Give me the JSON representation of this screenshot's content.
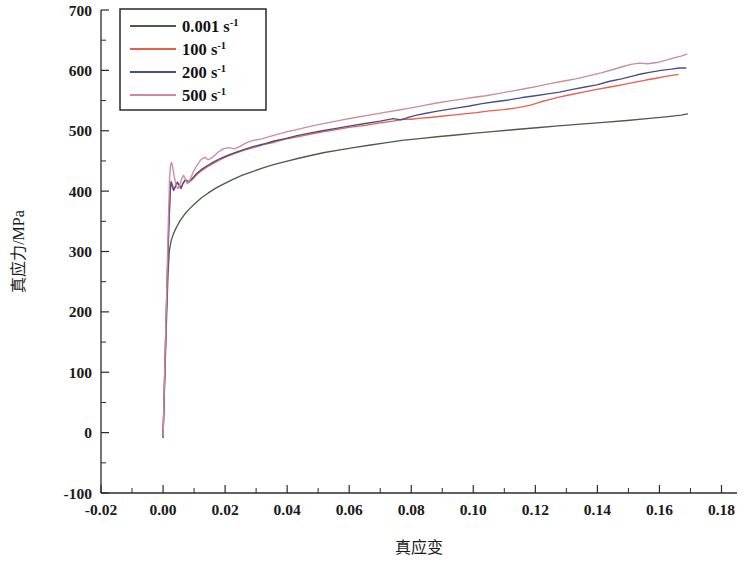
{
  "chart_data": {
    "type": "line",
    "title": "",
    "xlabel": "真应变",
    "ylabel": "真应力/MPa",
    "xlim": [
      -0.02,
      0.185
    ],
    "ylim": [
      -100,
      700
    ],
    "xticks": [
      -0.02,
      0.0,
      0.02,
      0.04,
      0.06,
      0.08,
      0.1,
      0.12,
      0.14,
      0.16,
      0.18
    ],
    "xticklabels": [
      "-0.02",
      "0.00",
      "0.02",
      "0.04",
      "0.06",
      "0.08",
      "0.10",
      "0.12",
      "0.14",
      "0.16",
      "0.18"
    ],
    "yticks": [
      -100,
      0,
      100,
      200,
      300,
      400,
      500,
      600,
      700
    ],
    "yticklabels": [
      "-100",
      "0",
      "100",
      "200",
      "300",
      "400",
      "500",
      "600",
      "700"
    ],
    "x_minor_step": 0.01,
    "y_minor_step": 50,
    "grid": false,
    "legend_position": "upper-left",
    "series": [
      {
        "name": "0.001 s",
        "exponent": "-1",
        "label_base": "0.001 s",
        "color": "#4e5b4a",
        "points": [
          [
            0.0,
            -8
          ],
          [
            0.0004,
            60
          ],
          [
            0.0008,
            130
          ],
          [
            0.0012,
            200
          ],
          [
            0.0016,
            262
          ],
          [
            0.002,
            300
          ],
          [
            0.0026,
            318
          ],
          [
            0.0034,
            330
          ],
          [
            0.0044,
            341
          ],
          [
            0.0056,
            352
          ],
          [
            0.007,
            362
          ],
          [
            0.0086,
            371
          ],
          [
            0.0104,
            380
          ],
          [
            0.0124,
            389
          ],
          [
            0.0146,
            397
          ],
          [
            0.017,
            405
          ],
          [
            0.0196,
            412
          ],
          [
            0.0224,
            419
          ],
          [
            0.0254,
            426
          ],
          [
            0.0286,
            432
          ],
          [
            0.032,
            438
          ],
          [
            0.0356,
            444
          ],
          [
            0.0394,
            449
          ],
          [
            0.0434,
            454
          ],
          [
            0.0476,
            459
          ],
          [
            0.052,
            464
          ],
          [
            0.0566,
            468
          ],
          [
            0.0614,
            472
          ],
          [
            0.0664,
            476
          ],
          [
            0.0716,
            480
          ],
          [
            0.077,
            484
          ],
          [
            0.0826,
            487
          ],
          [
            0.0884,
            490
          ],
          [
            0.0944,
            493
          ],
          [
            0.1006,
            496
          ],
          [
            0.107,
            499
          ],
          [
            0.1136,
            502
          ],
          [
            0.1204,
            505
          ],
          [
            0.1274,
            508
          ],
          [
            0.1346,
            511
          ],
          [
            0.142,
            514
          ],
          [
            0.1496,
            517
          ],
          [
            0.156,
            520
          ],
          [
            0.162,
            523
          ],
          [
            0.167,
            526
          ],
          [
            0.169,
            528
          ]
        ]
      },
      {
        "name": "100 s",
        "exponent": "-1",
        "label_base": "100 s",
        "color": "#e8604c",
        "points": [
          [
            0.0,
            -6
          ],
          [
            0.0006,
            110
          ],
          [
            0.0012,
            225
          ],
          [
            0.0018,
            330
          ],
          [
            0.0023,
            398
          ],
          [
            0.0026,
            416
          ],
          [
            0.003,
            410
          ],
          [
            0.0034,
            402
          ],
          [
            0.004,
            407
          ],
          [
            0.0046,
            414
          ],
          [
            0.0052,
            409
          ],
          [
            0.0058,
            404
          ],
          [
            0.0064,
            412
          ],
          [
            0.0072,
            418
          ],
          [
            0.0082,
            414
          ],
          [
            0.0094,
            419
          ],
          [
            0.0108,
            427
          ],
          [
            0.0124,
            434
          ],
          [
            0.0142,
            440
          ],
          [
            0.0162,
            446
          ],
          [
            0.0184,
            452
          ],
          [
            0.0208,
            458
          ],
          [
            0.0234,
            463
          ],
          [
            0.0262,
            468
          ],
          [
            0.0292,
            472
          ],
          [
            0.0324,
            477
          ],
          [
            0.0358,
            481
          ],
          [
            0.0394,
            486
          ],
          [
            0.0432,
            490
          ],
          [
            0.0472,
            494
          ],
          [
            0.0514,
            498
          ],
          [
            0.0558,
            502
          ],
          [
            0.0604,
            506
          ],
          [
            0.0652,
            509
          ],
          [
            0.07,
            513
          ],
          [
            0.0742,
            516
          ],
          [
            0.0772,
            519
          ],
          [
            0.08,
            519
          ],
          [
            0.083,
            521
          ],
          [
            0.0862,
            522
          ],
          [
            0.0896,
            524
          ],
          [
            0.0932,
            526
          ],
          [
            0.097,
            528
          ],
          [
            0.101,
            530
          ],
          [
            0.1052,
            533
          ],
          [
            0.1096,
            535
          ],
          [
            0.114,
            538
          ],
          [
            0.1182,
            542
          ],
          [
            0.1218,
            548
          ],
          [
            0.1248,
            552
          ],
          [
            0.128,
            556
          ],
          [
            0.1316,
            560
          ],
          [
            0.1354,
            564
          ],
          [
            0.1394,
            568
          ],
          [
            0.1436,
            572
          ],
          [
            0.1478,
            576
          ],
          [
            0.1518,
            580
          ],
          [
            0.1556,
            584
          ],
          [
            0.159,
            587
          ],
          [
            0.162,
            590
          ],
          [
            0.1645,
            592
          ],
          [
            0.166,
            593
          ]
        ]
      },
      {
        "name": "200 s",
        "exponent": "-1",
        "label_base": "200 s",
        "color": "#4a4d8c",
        "points": [
          [
            0.0,
            -7
          ],
          [
            0.0006,
            112
          ],
          [
            0.0012,
            228
          ],
          [
            0.0018,
            334
          ],
          [
            0.0023,
            400
          ],
          [
            0.0026,
            415
          ],
          [
            0.003,
            409
          ],
          [
            0.0034,
            401
          ],
          [
            0.004,
            408
          ],
          [
            0.0046,
            415
          ],
          [
            0.0052,
            410
          ],
          [
            0.0058,
            405
          ],
          [
            0.0064,
            413
          ],
          [
            0.0072,
            419
          ],
          [
            0.0082,
            416
          ],
          [
            0.0094,
            421
          ],
          [
            0.0108,
            429
          ],
          [
            0.0124,
            436
          ],
          [
            0.0142,
            442
          ],
          [
            0.0162,
            448
          ],
          [
            0.0184,
            454
          ],
          [
            0.0208,
            459
          ],
          [
            0.0234,
            464
          ],
          [
            0.0262,
            469
          ],
          [
            0.0292,
            474
          ],
          [
            0.0324,
            478
          ],
          [
            0.0358,
            483
          ],
          [
            0.0394,
            487
          ],
          [
            0.0432,
            492
          ],
          [
            0.0472,
            496
          ],
          [
            0.0514,
            500
          ],
          [
            0.0558,
            504
          ],
          [
            0.0604,
            508
          ],
          [
            0.0652,
            512
          ],
          [
            0.07,
            516
          ],
          [
            0.0742,
            520
          ],
          [
            0.0768,
            518
          ],
          [
            0.079,
            522
          ],
          [
            0.0818,
            526
          ],
          [
            0.0848,
            529
          ],
          [
            0.088,
            532
          ],
          [
            0.0914,
            535
          ],
          [
            0.095,
            538
          ],
          [
            0.0988,
            541
          ],
          [
            0.1028,
            545
          ],
          [
            0.107,
            548
          ],
          [
            0.1114,
            551
          ],
          [
            0.1158,
            555
          ],
          [
            0.12,
            558
          ],
          [
            0.124,
            561
          ],
          [
            0.1278,
            564
          ],
          [
            0.1316,
            568
          ],
          [
            0.1356,
            572
          ],
          [
            0.1398,
            576
          ],
          [
            0.144,
            582
          ],
          [
            0.1478,
            586
          ],
          [
            0.151,
            590
          ],
          [
            0.154,
            594
          ],
          [
            0.1572,
            597
          ],
          [
            0.1605,
            600
          ],
          [
            0.1638,
            602
          ],
          [
            0.1665,
            604
          ],
          [
            0.1685,
            604
          ]
        ]
      },
      {
        "name": "500 s",
        "exponent": "-1",
        "label_base": "500 s",
        "color": "#d08a9e",
        "points": [
          [
            0.0,
            -6
          ],
          [
            0.0006,
            118
          ],
          [
            0.0012,
            240
          ],
          [
            0.0017,
            350
          ],
          [
            0.0021,
            420
          ],
          [
            0.0024,
            442
          ],
          [
            0.0027,
            448
          ],
          [
            0.0031,
            440
          ],
          [
            0.0036,
            424
          ],
          [
            0.0042,
            410
          ],
          [
            0.0048,
            404
          ],
          [
            0.0054,
            410
          ],
          [
            0.006,
            420
          ],
          [
            0.0066,
            426
          ],
          [
            0.0072,
            420
          ],
          [
            0.0078,
            412
          ],
          [
            0.0086,
            418
          ],
          [
            0.0096,
            430
          ],
          [
            0.0108,
            442
          ],
          [
            0.0122,
            452
          ],
          [
            0.0134,
            456
          ],
          [
            0.0146,
            452
          ],
          [
            0.016,
            456
          ],
          [
            0.0176,
            464
          ],
          [
            0.0194,
            470
          ],
          [
            0.0212,
            472
          ],
          [
            0.023,
            470
          ],
          [
            0.0248,
            474
          ],
          [
            0.0268,
            480
          ],
          [
            0.029,
            484
          ],
          [
            0.0314,
            486
          ],
          [
            0.034,
            490
          ],
          [
            0.0368,
            494
          ],
          [
            0.0398,
            498
          ],
          [
            0.043,
            502
          ],
          [
            0.0464,
            506
          ],
          [
            0.05,
            510
          ],
          [
            0.0538,
            514
          ],
          [
            0.0578,
            518
          ],
          [
            0.062,
            522
          ],
          [
            0.0664,
            526
          ],
          [
            0.071,
            530
          ],
          [
            0.0756,
            534
          ],
          [
            0.08,
            538
          ],
          [
            0.0842,
            542
          ],
          [
            0.0882,
            546
          ],
          [
            0.092,
            549
          ],
          [
            0.0958,
            552
          ],
          [
            0.0998,
            555
          ],
          [
            0.104,
            558
          ],
          [
            0.1084,
            562
          ],
          [
            0.1128,
            566
          ],
          [
            0.117,
            570
          ],
          [
            0.121,
            574
          ],
          [
            0.1248,
            578
          ],
          [
            0.1288,
            582
          ],
          [
            0.133,
            586
          ],
          [
            0.1372,
            591
          ],
          [
            0.1412,
            596
          ],
          [
            0.1448,
            601
          ],
          [
            0.148,
            606
          ],
          [
            0.1508,
            610
          ],
          [
            0.1535,
            612
          ],
          [
            0.1562,
            611
          ],
          [
            0.1592,
            613
          ],
          [
            0.1622,
            617
          ],
          [
            0.165,
            621
          ],
          [
            0.1672,
            624
          ],
          [
            0.1688,
            627
          ]
        ]
      }
    ]
  },
  "legend": {
    "entries": [
      {
        "label": "0.001 s",
        "sup": "-1"
      },
      {
        "label": "100 s",
        "sup": "-1"
      },
      {
        "label": "200 s",
        "sup": "-1"
      },
      {
        "label": "500 s",
        "sup": "-1"
      }
    ]
  }
}
